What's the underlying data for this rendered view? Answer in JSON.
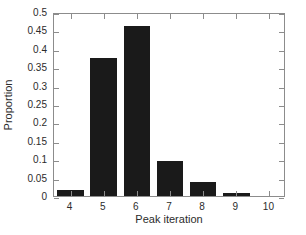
{
  "chart_data": {
    "type": "bar",
    "title": "",
    "subtitle": "",
    "xlabel": "Peak iteration",
    "ylabel": "Proportion",
    "categories": [
      4,
      5,
      6,
      7,
      8,
      9
    ],
    "values": [
      0.016,
      0.375,
      0.462,
      0.095,
      0.038,
      0.008
    ],
    "series": [
      {
        "name": "Proportion",
        "values": [
          0.016,
          0.375,
          0.462,
          0.095,
          0.038,
          0.008
        ]
      }
    ],
    "xlim": [
      3.5,
      10.5
    ],
    "ylim": [
      0,
      0.5
    ],
    "xticks": [
      4,
      5,
      6,
      7,
      8,
      9,
      10
    ],
    "xtick_labels": [
      "4",
      "5",
      "6",
      "7",
      "8",
      "9",
      "10"
    ],
    "yticks": [
      0,
      0.05,
      0.1,
      0.15,
      0.2,
      0.25,
      0.3,
      0.35,
      0.4,
      0.45,
      0.5
    ],
    "ytick_labels": [
      "0",
      "0.05",
      "0.1",
      "0.15",
      "0.2",
      "0.25",
      "0.3",
      "0.35",
      "0.4",
      "0.45",
      "0.5"
    ],
    "grid": false,
    "legend": null,
    "legend_position": "none",
    "bar_width_fraction": 0.8,
    "annotations": []
  },
  "style": {
    "bar_color": "#1a1a1a",
    "axis_color": "#8c8c8c",
    "tick_label_color": "#2b2b2b",
    "background_color": "#ffffff"
  }
}
